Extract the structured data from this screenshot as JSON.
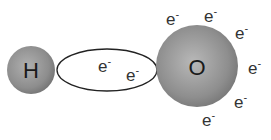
{
  "diagram": {
    "title": "",
    "atoms": [
      {
        "id": "hydrogen",
        "label": "H"
      },
      {
        "id": "oxygen",
        "label": "O"
      }
    ],
    "bond": {
      "type": "shared-electron-pair",
      "electrons": [
        {
          "label": "e",
          "charge": "-"
        },
        {
          "label": "e",
          "charge": "-"
        }
      ]
    },
    "oxygen_lone_electrons": [
      {
        "label": "e",
        "charge": "-"
      },
      {
        "label": "e",
        "charge": "-"
      },
      {
        "label": "e",
        "charge": "-"
      },
      {
        "label": "e",
        "charge": "-"
      },
      {
        "label": "e",
        "charge": "-"
      },
      {
        "label": "e",
        "charge": "-"
      }
    ],
    "colors": {
      "atom_fill": "#8a8a8a",
      "atom_highlight": "#b5b5b5",
      "bond_stroke": "#222222",
      "text": "#222222"
    }
  }
}
